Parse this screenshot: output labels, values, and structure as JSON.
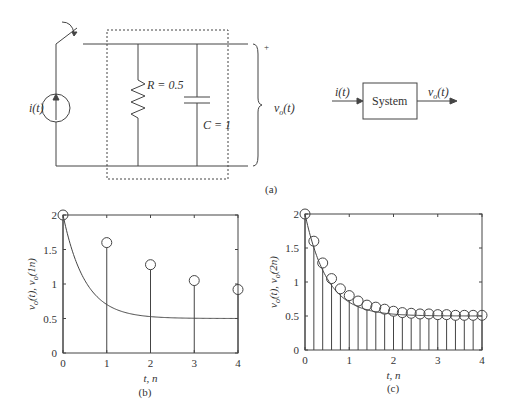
{
  "circuit": {
    "source_label": "i(t)",
    "resistor_label": "R = 0.5",
    "capacitor_label": "C = 1",
    "output_label": "v",
    "output_sub": "o",
    "output_suffix": "(t)",
    "plus_sign": "+",
    "minus_sign": "−"
  },
  "block_diagram": {
    "input_label": "i(t)",
    "block_label": "System",
    "output_label": "v",
    "output_sub": "o",
    "output_suffix": "(t)"
  },
  "captions": {
    "a": "(a)",
    "b": "(b)",
    "c": "(c)"
  },
  "chart_data": [
    {
      "type": "line+stem",
      "title": "",
      "xlabel": "t, n",
      "ylabel": "vo(t), vo(1n)",
      "xlim": [
        0,
        4
      ],
      "ylim": [
        0,
        2
      ],
      "xticks": [
        "0",
        "1",
        "2",
        "3",
        "4"
      ],
      "yticks": [
        "0",
        "0.5",
        "1",
        "1.5",
        "2"
      ],
      "series": [
        {
          "name": "vo(t) continuous",
          "kind": "line",
          "formula": "0.5+1.5*exp(-2t)"
        },
        {
          "name": "vo(1n) sampled",
          "kind": "stem",
          "x": [
            0,
            1,
            2,
            3,
            4
          ],
          "values": [
            2.0,
            1.6,
            1.28,
            1.05,
            0.92
          ]
        }
      ]
    },
    {
      "type": "line+stem",
      "title": "",
      "xlabel": "t, n",
      "ylabel": "vo(t), vo(2n)",
      "xlim": [
        0,
        4
      ],
      "ylim": [
        0,
        2
      ],
      "xticks": [
        "0",
        "1",
        "2",
        "3",
        "4"
      ],
      "yticks": [
        "0",
        "0.5",
        "1",
        "1.5",
        "2"
      ],
      "series": [
        {
          "name": "vo(t) continuous",
          "kind": "line",
          "formula": "0.5+1.5*exp(-2t)"
        },
        {
          "name": "vo(2n) sampled",
          "kind": "stem",
          "x": [
            0,
            0.2,
            0.4,
            0.6,
            0.8,
            1.0,
            1.2,
            1.4,
            1.6,
            1.8,
            2.0,
            2.2,
            2.4,
            2.6,
            2.8,
            3.0,
            3.2,
            3.4,
            3.6,
            3.8,
            4.0
          ],
          "values": [
            2.0,
            1.6,
            1.28,
            1.05,
            0.9,
            0.8,
            0.72,
            0.66,
            0.63,
            0.6,
            0.57,
            0.55,
            0.54,
            0.53,
            0.53,
            0.52,
            0.52,
            0.51,
            0.51,
            0.51,
            0.51
          ]
        }
      ]
    }
  ]
}
